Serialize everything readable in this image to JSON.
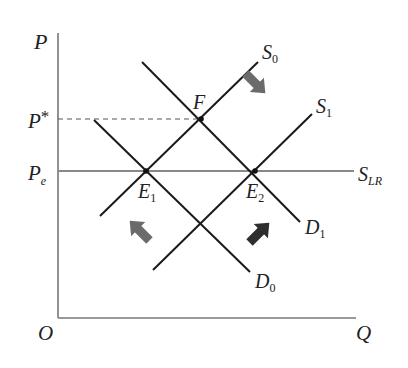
{
  "diagram": {
    "type": "supply-demand",
    "axes": {
      "y_label": "P",
      "x_label": "Q",
      "origin_label": "O"
    },
    "price_levels": {
      "p_star": {
        "label": "P",
        "mark": "*"
      },
      "p_e": {
        "label": "P",
        "sub": "e"
      }
    },
    "curves": {
      "S0": {
        "label": "S",
        "sub": "0"
      },
      "S1": {
        "label": "S",
        "sub": "1"
      },
      "SLR": {
        "label": "S",
        "sub": "LR"
      },
      "D0": {
        "label": "D",
        "sub": "0"
      },
      "D1": {
        "label": "D",
        "sub": "1"
      }
    },
    "points": {
      "E1": {
        "label": "E",
        "sub": "1"
      },
      "E2": {
        "label": "E",
        "sub": "2"
      },
      "F": {
        "label": "F"
      }
    },
    "arrows": [
      {
        "name": "supply-shift-arrow",
        "direction": "down-right",
        "color": "#6b6b6b"
      },
      {
        "name": "demand-shift-arrow",
        "direction": "up-right",
        "color": "#2e2e2e"
      },
      {
        "name": "demand-back-arrow",
        "direction": "up-left",
        "color": "#6b6b6b"
      }
    ],
    "colors": {
      "line": "#1a1a1a",
      "axis": "#777777",
      "slr": "#888888"
    }
  }
}
